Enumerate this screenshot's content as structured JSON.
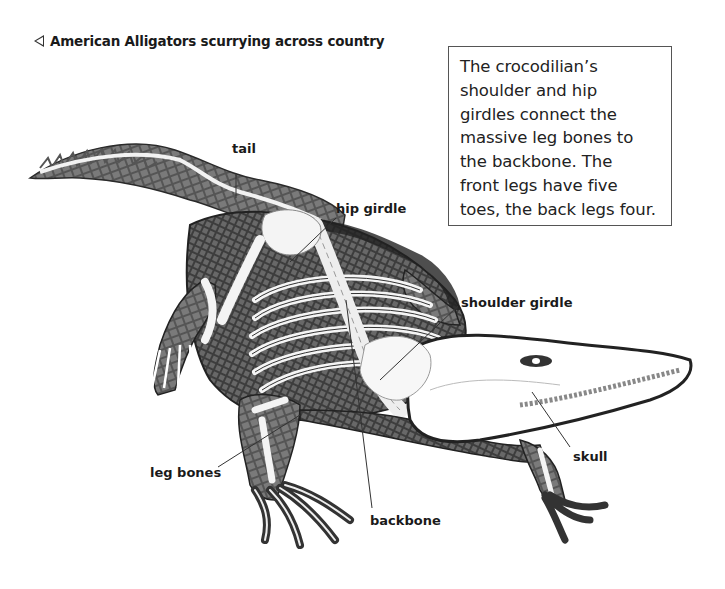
{
  "caption": {
    "icon": "left-triangle-icon",
    "text": "American Alligators scurrying across country"
  },
  "infobox": {
    "lines": [
      "The crocodilian’s",
      "shoulder and hip",
      "girdles connect the",
      "massive leg bones to",
      "the backbone. The",
      "front legs have five",
      "toes, the back legs four."
    ]
  },
  "labels": {
    "tail": "tail",
    "hip_girdle": "hip girdle",
    "shoulder_girdle": "shoulder girdle",
    "skull": "skull",
    "leg_bones": "leg bones",
    "backbone": "backbone"
  },
  "colors": {
    "skin_dark": "#3a3a3a",
    "skin_mid": "#6b6b6b",
    "bone": "#f4f4f4",
    "outline": "#2a2a2a"
  }
}
